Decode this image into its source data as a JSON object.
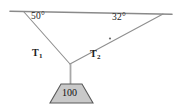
{
  "figure": {
    "type": "free-body-diagram",
    "ceiling": {
      "label": "ceiling-line",
      "x1": 10,
      "y1": 11,
      "x2": 172,
      "y2": 14,
      "color": "#8a8a8a"
    },
    "junction": {
      "x": 70,
      "y": 64
    },
    "anchor_left": {
      "x": 24,
      "y": 12
    },
    "anchor_right": {
      "x": 163,
      "y": 14
    },
    "rope_color": "#8a8a8a",
    "angles": [
      {
        "name": "angle-left",
        "value": "50°",
        "at_anchor": "left"
      },
      {
        "name": "angle-right",
        "value": "32°",
        "at_anchor": "right"
      }
    ],
    "tensions": [
      {
        "name": "tension-1",
        "symbol": "T",
        "subscript": "1"
      },
      {
        "name": "tension-2",
        "symbol": "T",
        "subscript": "2"
      }
    ],
    "block": {
      "label": "100",
      "fill": "#c9c9c9",
      "stroke": "#555555",
      "top_left_x": 61,
      "top_right_x": 82,
      "top_y": 84,
      "bottom_left_x": 50,
      "bottom_right_x": 93,
      "bottom_y": 103
    },
    "marker_dot": {
      "x": 110,
      "y": 38,
      "name": "rope-tick-marker"
    }
  }
}
